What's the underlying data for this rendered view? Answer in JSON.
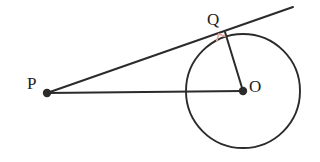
{
  "figure": {
    "name": "tangent-line-to-circle-diagram",
    "background_color": "#ffffff",
    "stroke_color": "#2b2b2b",
    "right_angle_color": "#e8a49a",
    "width": 320,
    "height": 162
  },
  "labels": {
    "point_p": "P",
    "point_q": "Q",
    "point_o": "O"
  },
  "geometry": {
    "circle": {
      "center_x": 243,
      "center_y": 91,
      "radius": 57,
      "stroke_width": 1.9
    },
    "point_p": {
      "x": 47,
      "y": 93,
      "dot_radius": 4.2
    },
    "point_o": {
      "x": 243,
      "y": 91,
      "dot_radius": 4.2
    },
    "point_q": {
      "x": 225,
      "y": 32,
      "dot_radius": 0
    },
    "segment_po": {
      "x1": 47,
      "y1": 93,
      "x2": 243,
      "y2": 91,
      "stroke_width": 2.0
    },
    "segment_pq_tangent": {
      "x1": 47,
      "y1": 93,
      "x2": 293,
      "y2": 7,
      "stroke_width": 2.0
    },
    "segment_oq_radius": {
      "x1": 243,
      "y1": 91,
      "x2": 225,
      "y2": 32,
      "stroke_width": 2.0
    },
    "right_angle_marker": {
      "points": "216.5,41.5 218.8,34.1 225.5,36.4",
      "stroke_width": 1.6
    }
  },
  "label_positions": {
    "p": {
      "x": 27,
      "y": 89
    },
    "q": {
      "x": 207,
      "y": 25
    },
    "o": {
      "x": 249,
      "y": 92
    }
  }
}
